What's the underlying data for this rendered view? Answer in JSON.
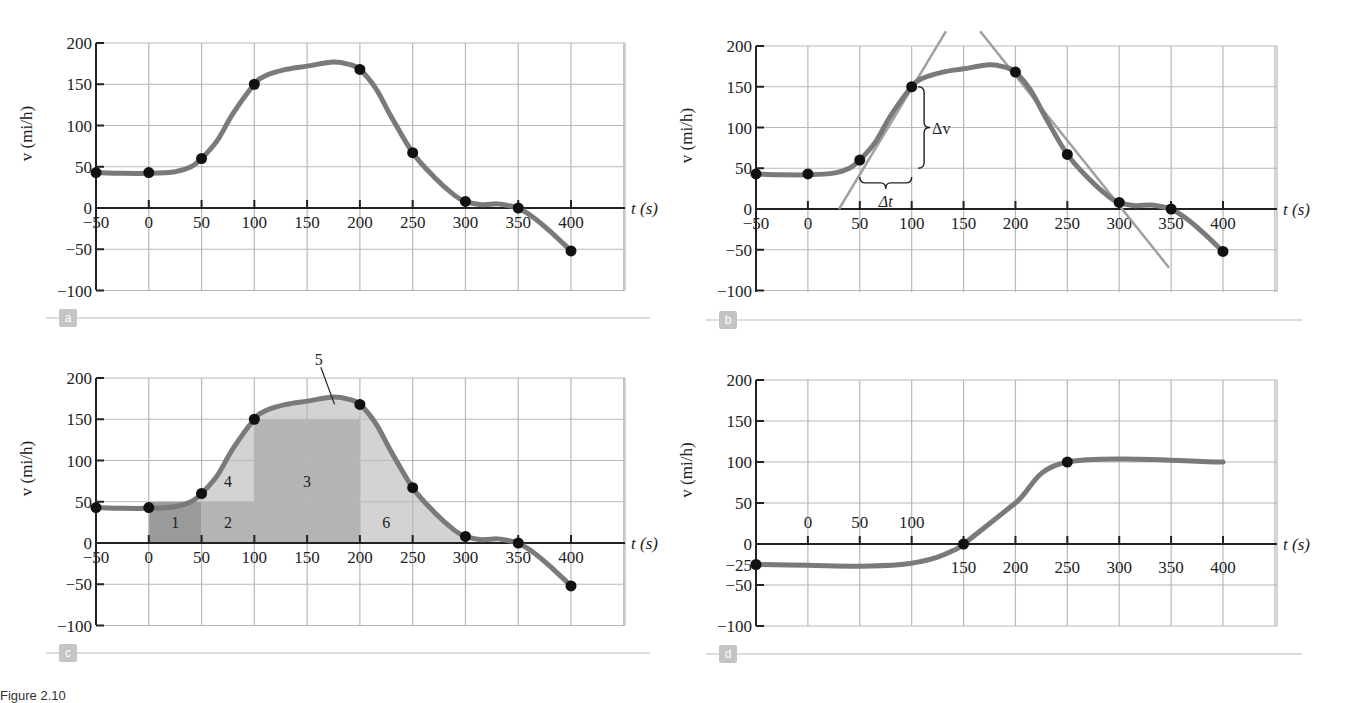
{
  "chart_data": [
    {
      "panel": "a",
      "type": "line",
      "title": "",
      "xlabel": "t (s)",
      "ylabel": "v (mi/h)",
      "xlim": [
        -50,
        450
      ],
      "ylim": [
        -100,
        200
      ],
      "x_ticks": [
        -50,
        0,
        50,
        100,
        150,
        200,
        250,
        300,
        350,
        400
      ],
      "y_ticks": [
        200,
        150,
        100,
        50,
        0,
        -50,
        -100
      ],
      "grid": true,
      "points": {
        "x": [
          -50,
          0,
          50,
          100,
          200,
          250,
          300,
          350,
          400
        ],
        "y": [
          43,
          43,
          60,
          150,
          168,
          67,
          8,
          0,
          -52
        ]
      },
      "curve": {
        "x": [
          -50,
          -25,
          0,
          25,
          40,
          50,
          65,
          80,
          100,
          110,
          130,
          150,
          175,
          190,
          200,
          215,
          230,
          250,
          270,
          290,
          300,
          315,
          330,
          340,
          350,
          365,
          380,
          400
        ],
        "y": [
          43,
          42,
          42,
          44,
          50,
          60,
          82,
          115,
          150,
          160,
          168,
          172,
          177,
          174,
          168,
          145,
          110,
          67,
          38,
          15,
          8,
          4,
          5,
          3,
          0,
          -12,
          -28,
          -52
        ]
      }
    },
    {
      "panel": "b",
      "type": "line",
      "xlabel": "t (s)",
      "ylabel": "v (mi/h)",
      "xlim": [
        -50,
        450
      ],
      "ylim": [
        -100,
        200
      ],
      "x_ticks": [
        -50,
        0,
        50,
        100,
        150,
        200,
        250,
        300,
        350,
        400
      ],
      "y_ticks": [
        200,
        150,
        100,
        50,
        0,
        -50,
        -100
      ],
      "grid": true,
      "points": {
        "x": [
          -50,
          0,
          50,
          100,
          200,
          250,
          300,
          350,
          400
        ],
        "y": [
          43,
          43,
          60,
          150,
          168,
          67,
          8,
          0,
          -52
        ]
      },
      "curve": {
        "x": [
          -50,
          -25,
          0,
          25,
          40,
          50,
          65,
          80,
          100,
          110,
          130,
          150,
          175,
          190,
          200,
          215,
          230,
          250,
          270,
          290,
          300,
          315,
          330,
          340,
          350,
          365,
          380,
          400
        ],
        "y": [
          43,
          42,
          42,
          44,
          50,
          60,
          82,
          115,
          150,
          160,
          168,
          172,
          177,
          174,
          168,
          145,
          110,
          67,
          38,
          15,
          8,
          4,
          5,
          3,
          0,
          -12,
          -28,
          -52
        ]
      },
      "tangent_lines": [
        {
          "x": [
            30,
            133
          ],
          "y": [
            0,
            218
          ]
        },
        {
          "x": [
            166,
            348
          ],
          "y": [
            218,
            -72
          ]
        }
      ],
      "annotations": [
        {
          "text": "Δv",
          "note": "vertical brace from v=50 to v=150 at t≈112"
        },
        {
          "text": "Δt",
          "note": "horizontal brace from t=50 to t=100 at v≈32"
        }
      ]
    },
    {
      "panel": "c",
      "type": "area",
      "xlabel": "t (s)",
      "ylabel": "v (mi/h)",
      "xlim": [
        -50,
        450
      ],
      "ylim": [
        -100,
        200
      ],
      "x_ticks": [
        -50,
        0,
        50,
        100,
        150,
        200,
        250,
        300,
        350,
        400
      ],
      "y_ticks": [
        200,
        150,
        100,
        50,
        0,
        -50,
        -100
      ],
      "grid": true,
      "points": {
        "x": [
          -50,
          0,
          50,
          100,
          200,
          250,
          300,
          350,
          400
        ],
        "y": [
          43,
          43,
          60,
          150,
          168,
          67,
          8,
          0,
          -52
        ]
      },
      "curve": {
        "x": [
          -50,
          -25,
          0,
          25,
          40,
          50,
          65,
          80,
          100,
          110,
          130,
          150,
          175,
          190,
          200,
          215,
          230,
          250,
          270,
          290,
          300,
          315,
          330,
          340,
          350,
          365,
          380,
          400
        ],
        "y": [
          43,
          42,
          42,
          44,
          50,
          60,
          82,
          115,
          150,
          160,
          168,
          172,
          177,
          174,
          168,
          145,
          110,
          67,
          38,
          15,
          8,
          4,
          5,
          3,
          0,
          -12,
          -28,
          -52
        ]
      },
      "regions": [
        {
          "label": "1",
          "note": "rectangle t 0–50, v 0–50 (darkest)"
        },
        {
          "label": "2",
          "note": "rectangle t 50–100, v 0–50"
        },
        {
          "label": "3",
          "note": "rectangle t 100–200, v 0–150"
        },
        {
          "label": "4",
          "note": "region between curve and v=50, t 50–100"
        },
        {
          "label": "5",
          "note": "region between curve and v=150, t 100–200"
        },
        {
          "label": "6",
          "note": "region under curve t 200–300"
        }
      ]
    },
    {
      "panel": "d",
      "type": "line",
      "xlabel": "t (s)",
      "ylabel": "v (mi/h)",
      "xlim": [
        -50,
        450
      ],
      "ylim": [
        -100,
        200
      ],
      "x_ticks_above": [
        0,
        50,
        100
      ],
      "x_ticks_below": [
        150,
        200,
        250,
        300,
        350,
        400
      ],
      "y_ticks": [
        200,
        150,
        100,
        50,
        0,
        -25,
        -50,
        -100
      ],
      "grid": true,
      "points": {
        "x": [
          -50,
          150,
          250
        ],
        "y": [
          -25,
          0,
          100
        ]
      },
      "curve": {
        "x": [
          -50,
          0,
          50,
          90,
          110,
          125,
          140,
          150,
          200,
          250,
          400
        ],
        "y": [
          -25,
          -26,
          -27,
          -25,
          -21,
          -16,
          -8,
          0,
          50,
          100,
          100
        ]
      }
    }
  ],
  "panels": {
    "a": {
      "letter": "a",
      "xlabel": "t (s)",
      "ylabel": "v (mi/h)"
    },
    "b": {
      "letter": "b",
      "xlabel": "t (s)",
      "ylabel": "v (mi/h)",
      "dv": "Δv",
      "dt": "Δt"
    },
    "c": {
      "letter": "c",
      "xlabel": "t (s)",
      "ylabel": "v (mi/h)",
      "labels": [
        "1",
        "2",
        "3",
        "4",
        "5",
        "6"
      ]
    },
    "d": {
      "letter": "d",
      "xlabel": "t (s)",
      "ylabel": "v (mi/h)"
    }
  },
  "layout": {
    "a": {
      "x0": 96,
      "x1": 571,
      "t0": -50,
      "t1": 400,
      "yTop": 43,
      "yZero": 208,
      "yBottom": 290,
      "gridRight": 625
    },
    "b": {
      "x0": 756,
      "x1": 1223,
      "t0": -50,
      "t1": 400,
      "yTop": 46,
      "yZero": 209,
      "yBottom": 292,
      "gridRight": 1277
    },
    "c": {
      "x0": 96,
      "x1": 571,
      "t0": -50,
      "t1": 400,
      "yTop": 378,
      "yZero": 543,
      "yBottom": 625,
      "gridRight": 625
    },
    "d": {
      "x0": 756,
      "x1": 1223,
      "t0": -50,
      "t1": 400,
      "yTop": 380,
      "yZero": 544,
      "yBottom": 626,
      "gridRight": 1277
    }
  },
  "colors": {
    "curve": "#7a7a7a",
    "point": "#111111",
    "grid": "#b8b8b8",
    "axis": "#222222",
    "tangent": "#a0a0a0",
    "shade_dark": "#9a9a9a",
    "shade_mid": "#b4b4b4",
    "shade_light": "#d3d3d3",
    "badge": "#c4c4c4",
    "rule": "#d0d0d0"
  },
  "caption": {
    "text": "Figure 2.10"
  }
}
